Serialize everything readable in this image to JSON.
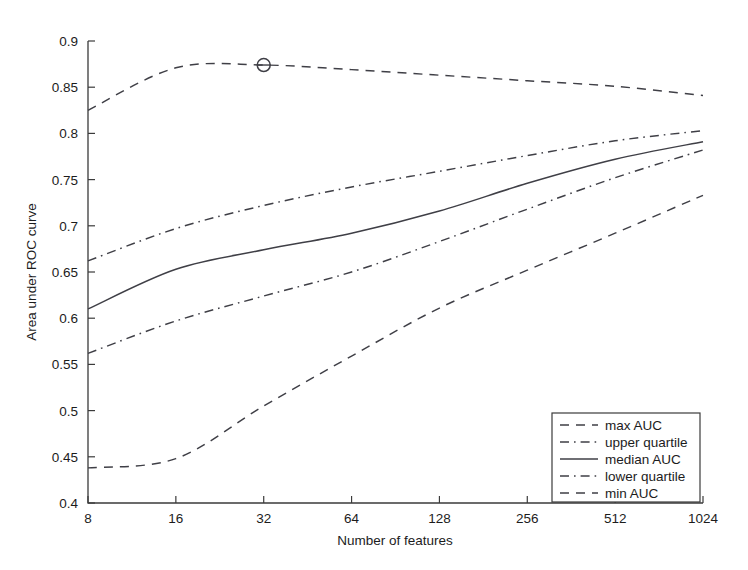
{
  "chart_data": {
    "type": "line",
    "title": "",
    "xlabel": "Number of features",
    "ylabel": "Area under ROC curve",
    "x": [
      8,
      16,
      32,
      64,
      128,
      256,
      512,
      1024
    ],
    "xtick_labels": [
      "8",
      "16",
      "32",
      "64",
      "128",
      "256",
      "512",
      "1024"
    ],
    "xscale": "log2",
    "ytick_labels": [
      "0.4",
      "0.45",
      "0.5",
      "0.55",
      "0.6",
      "0.65",
      "0.7",
      "0.75",
      "0.8",
      "0.85",
      "0.9"
    ],
    "ytick_values": [
      0.4,
      0.45,
      0.5,
      0.55,
      0.6,
      0.65,
      0.7,
      0.75,
      0.8,
      0.85,
      0.9
    ],
    "ylim": [
      0.4,
      0.9
    ],
    "grid": false,
    "legend_position": "lower-right",
    "series": [
      {
        "name": "max AUC",
        "style": "dashed",
        "values": [
          0.825,
          0.871,
          0.874,
          0.869,
          0.863,
          0.857,
          0.851,
          0.841
        ]
      },
      {
        "name": "upper quartile",
        "style": "dash-dot",
        "values": [
          0.662,
          0.697,
          0.722,
          0.742,
          0.759,
          0.776,
          0.792,
          0.803
        ]
      },
      {
        "name": "median AUC",
        "style": "solid",
        "values": [
          0.61,
          0.653,
          0.674,
          0.692,
          0.716,
          0.746,
          0.772,
          0.791
        ]
      },
      {
        "name": "lower quartile",
        "style": "dash-dot",
        "values": [
          0.562,
          0.597,
          0.624,
          0.65,
          0.683,
          0.718,
          0.752,
          0.782
        ]
      },
      {
        "name": "min AUC",
        "style": "dashed",
        "values": [
          0.438,
          0.448,
          0.505,
          0.559,
          0.611,
          0.652,
          0.692,
          0.733
        ]
      }
    ],
    "annotations": [
      {
        "type": "circle-marker",
        "series": "max AUC",
        "x": 32,
        "y": 0.874,
        "label": "peak-max-auc-marker"
      }
    ]
  },
  "legend": {
    "entries": [
      {
        "label": "max AUC"
      },
      {
        "label": "upper quartile"
      },
      {
        "label": "median AUC"
      },
      {
        "label": "lower quartile"
      },
      {
        "label": "min AUC"
      }
    ]
  },
  "colors": {
    "line": "#3f3f46",
    "axis": "#3b3b3b",
    "background": "#ffffff",
    "text": "#1c1c1c"
  }
}
